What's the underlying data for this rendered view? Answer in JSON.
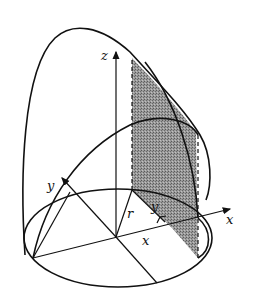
{
  "figure": {
    "labels": {
      "z_axis": "z",
      "y_axis": "y",
      "x_axis": "x",
      "radius": "r",
      "x_distance": "x",
      "y_distance": "y"
    },
    "colors": {
      "line": "#111111",
      "shade": "#8a8a8a",
      "background": "#ffffff"
    }
  }
}
